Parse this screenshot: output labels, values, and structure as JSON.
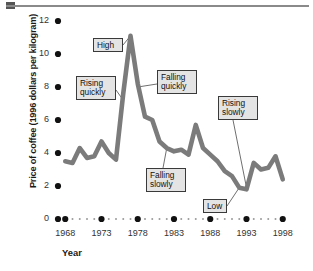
{
  "figure": {
    "top_rule": "decorative-rule"
  },
  "chart_data": {
    "type": "line",
    "title": "",
    "xlabel": "Year",
    "ylabel": "Price of coffee (1996 dollars per kilogram)",
    "xlim": [
      1967,
      1999
    ],
    "ylim": [
      0,
      12
    ],
    "grid": false,
    "legend": "none",
    "y_ticks": [
      0,
      2,
      4,
      6,
      8,
      10,
      12
    ],
    "y_tick_labels": [
      "0",
      "2",
      "4",
      "6",
      "8",
      "10",
      "12"
    ],
    "x_ticks": [
      1968,
      1973,
      1978,
      1983,
      1988,
      1993,
      1998
    ],
    "x_tick_labels": [
      "1968",
      "1973",
      "1978",
      "1983",
      "1988",
      "1993",
      "1998"
    ],
    "x_minor_dots_between_major": 4,
    "series_name": "Price of coffee",
    "line_color": "#7b7b7b",
    "x": [
      1968,
      1969,
      1970,
      1971,
      1972,
      1973,
      1974,
      1975,
      1976,
      1977,
      1978,
      1979,
      1980,
      1981,
      1982,
      1983,
      1984,
      1985,
      1986,
      1987,
      1988,
      1989,
      1990,
      1991,
      1992,
      1993,
      1994,
      1995,
      1996,
      1997,
      1998
    ],
    "values": [
      3.5,
      3.4,
      4.3,
      3.7,
      3.8,
      4.7,
      4.0,
      3.6,
      7.6,
      11.1,
      8.2,
      6.2,
      6.0,
      4.7,
      4.3,
      4.1,
      4.2,
      3.9,
      5.7,
      4.3,
      3.9,
      3.5,
      2.9,
      2.6,
      1.9,
      1.8,
      3.4,
      3.0,
      3.1,
      3.8,
      2.4
    ],
    "annotations": [
      {
        "id": "high",
        "label": "High",
        "target_year": 1977,
        "target_value": 11.1
      },
      {
        "id": "rising-quickly",
        "label": "Rising\nquickly",
        "target_year": 1976,
        "target_value": 7.2
      },
      {
        "id": "falling-quickly",
        "label": "Falling\nquickly",
        "target_year": 1978,
        "target_value": 8.0
      },
      {
        "id": "falling-slowly",
        "label": "Falling\nslowly",
        "target_year": 1982,
        "target_value": 4.3
      },
      {
        "id": "rising-slowly",
        "label": "Rising\nslowly",
        "target_year": 1993,
        "target_value": 1.9
      },
      {
        "id": "low",
        "label": "Low",
        "target_year": 1992,
        "target_value": 1.9
      }
    ]
  }
}
